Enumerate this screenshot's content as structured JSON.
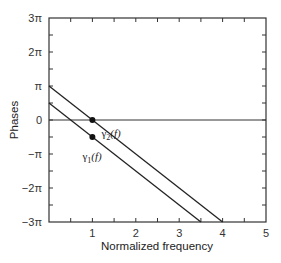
{
  "chart_data": {
    "type": "line",
    "title": "",
    "xlabel": "Normalized frequency",
    "ylabel": "Phases",
    "xlim": [
      0,
      5
    ],
    "ylim_pi": [
      -3,
      3
    ],
    "ylim": [
      -9.4248,
      9.4248
    ],
    "grid": false,
    "legend": "inline labels",
    "x_ticks": [
      0,
      0.5,
      1,
      1.5,
      2,
      2.5,
      3,
      3.5,
      4,
      4.5,
      5
    ],
    "x_tick_labels": [
      {
        "value": 1,
        "label": "1"
      },
      {
        "value": 2,
        "label": "2"
      },
      {
        "value": 3,
        "label": "3"
      },
      {
        "value": 4,
        "label": "4"
      },
      {
        "value": 5,
        "label": "5"
      }
    ],
    "y_ticks_pi": [
      -3,
      -2.5,
      -2,
      -1.5,
      -1,
      -0.5,
      0,
      0.5,
      1,
      1.5,
      2,
      2.5,
      3
    ],
    "y_tick_labels": [
      {
        "value_pi": 3,
        "label": "3π"
      },
      {
        "value_pi": 2,
        "label": "2π"
      },
      {
        "value_pi": 1,
        "label": "π"
      },
      {
        "value_pi": 0,
        "label": "0"
      },
      {
        "value_pi": -1,
        "label": "−π"
      },
      {
        "value_pi": -2,
        "label": "−2π"
      },
      {
        "value_pi": -3,
        "label": "−3π"
      }
    ],
    "series": [
      {
        "name": "γ2(f)",
        "label_main": "γ",
        "label_sub": "2",
        "label_tail": "(f)",
        "x": [
          0,
          4
        ],
        "y_pi": [
          1,
          -3
        ],
        "marker": {
          "x": 1,
          "y_pi": 0
        }
      },
      {
        "name": "γ1(f)",
        "label_main": "γ",
        "label_sub": "1",
        "label_tail": "(f)",
        "x": [
          0,
          3.5
        ],
        "y_pi": [
          0.5,
          -3
        ],
        "marker": {
          "x": 1,
          "y_pi": -0.5
        }
      }
    ],
    "reference_lines": [
      {
        "orientation": "horizontal",
        "y_pi": 0
      }
    ]
  }
}
